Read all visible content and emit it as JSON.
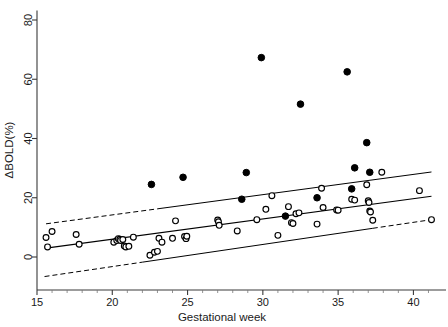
{
  "chart_data": {
    "type": "scatter",
    "title": "",
    "xlabel": "Gestational week",
    "ylabel": "ΔBOLD(%)",
    "xlim": [
      15,
      41.5
    ],
    "ylim": [
      -8,
      83
    ],
    "xticks": [
      15,
      20,
      25,
      30,
      35,
      40
    ],
    "yticks": [
      0,
      20,
      40,
      60,
      80
    ],
    "xtick_labels": [
      "15",
      "20",
      "25",
      "30",
      "35",
      "40"
    ],
    "ytick_labels": [
      "0",
      "20",
      "40",
      "60",
      "80"
    ],
    "grid": false,
    "legend": "none",
    "series": [
      {
        "name": "open-circles",
        "marker": "open circle",
        "points": [
          [
            15.6,
            6.6
          ],
          [
            15.7,
            3.4
          ],
          [
            16.0,
            8.6
          ],
          [
            17.6,
            7.6
          ],
          [
            17.8,
            4.3
          ],
          [
            20.1,
            5.0
          ],
          [
            20.3,
            5.6
          ],
          [
            20.4,
            6.2
          ],
          [
            20.5,
            6.0
          ],
          [
            20.55,
            5.6
          ],
          [
            20.7,
            5.9
          ],
          [
            20.8,
            3.7
          ],
          [
            20.9,
            3.4
          ],
          [
            21.1,
            3.6
          ],
          [
            21.4,
            6.7
          ],
          [
            22.5,
            0.6
          ],
          [
            22.8,
            1.6
          ],
          [
            23.0,
            1.9
          ],
          [
            23.1,
            6.3
          ],
          [
            23.3,
            5.0
          ],
          [
            24.0,
            6.3
          ],
          [
            24.2,
            12.2
          ],
          [
            24.8,
            6.9
          ],
          [
            24.9,
            6.2
          ],
          [
            24.95,
            7.0
          ],
          [
            27.0,
            12.5
          ],
          [
            27.05,
            11.9
          ],
          [
            27.1,
            10.7
          ],
          [
            28.3,
            8.8
          ],
          [
            29.6,
            12.6
          ],
          [
            30.2,
            16.1
          ],
          [
            30.6,
            20.7
          ],
          [
            31.0,
            7.3
          ],
          [
            31.7,
            17.0
          ],
          [
            31.9,
            11.6
          ],
          [
            32.0,
            11.3
          ],
          [
            32.2,
            14.6
          ],
          [
            32.4,
            14.9
          ],
          [
            33.6,
            11.1
          ],
          [
            33.9,
            23.2
          ],
          [
            34.0,
            16.7
          ],
          [
            34.9,
            15.9
          ],
          [
            35.0,
            15.8
          ],
          [
            35.9,
            19.5
          ],
          [
            36.1,
            19.2
          ],
          [
            36.9,
            24.4
          ],
          [
            37.0,
            19.0
          ],
          [
            37.05,
            18.4
          ],
          [
            37.1,
            15.5
          ],
          [
            37.15,
            15.2
          ],
          [
            37.3,
            12.4
          ],
          [
            37.9,
            28.6
          ],
          [
            40.4,
            22.4
          ],
          [
            41.2,
            12.6
          ]
        ]
      },
      {
        "name": "filled-circles",
        "marker": "filled circle",
        "points": [
          [
            22.6,
            24.5
          ],
          [
            24.7,
            26.9
          ],
          [
            28.6,
            19.5
          ],
          [
            28.9,
            28.5
          ],
          [
            29.9,
            67.3
          ],
          [
            31.5,
            13.8
          ],
          [
            32.5,
            51.6
          ],
          [
            33.6,
            20.0
          ],
          [
            35.6,
            62.5
          ],
          [
            35.9,
            23.0
          ],
          [
            36.1,
            30.1
          ],
          [
            36.9,
            38.6
          ],
          [
            37.1,
            28.6
          ]
        ]
      }
    ],
    "lines": [
      {
        "name": "regression-fit",
        "style": "solid",
        "x": [
          15.6,
          41.2
        ],
        "y": [
          3.0,
          20.5
        ]
      },
      {
        "name": "upper-prediction-band",
        "style": "solid-right-dashed-left",
        "x": [
          15.6,
          41.2
        ],
        "y": [
          11.2,
          28.7
        ],
        "dash_break_x": 23.0
      },
      {
        "name": "lower-prediction-band",
        "style": "dashed-left-dashed-right",
        "x": [
          15.5,
          41.2
        ],
        "y": [
          -6.6,
          12.6
        ],
        "solid_start_x": 22.0,
        "solid_end_x": 37.3
      }
    ]
  },
  "figure": {
    "background_color": "#ffffff",
    "axis_color": "#3a3a3a",
    "marker_color": "#000000"
  }
}
